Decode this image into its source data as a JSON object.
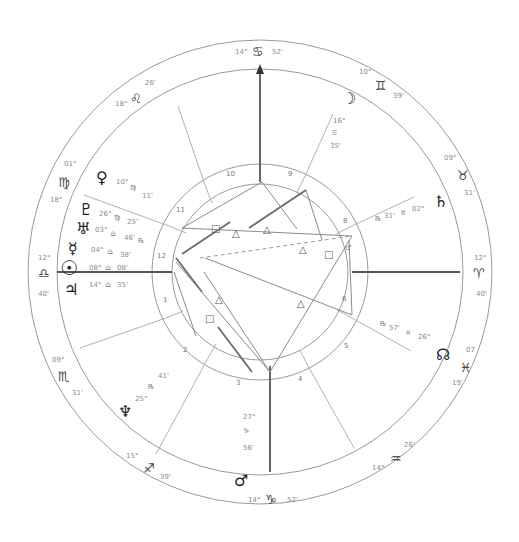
{
  "chart": {
    "type": "natal-chart-wheel",
    "center": [
      260,
      272
    ],
    "radii": {
      "outer": 232,
      "sign_inner": 203,
      "house_outer": 108,
      "house_inner": 88
    },
    "colors": {
      "ring": "#9a9a9a",
      "axis": "#555555",
      "glyph": "#222222",
      "text": "#8a8a8a"
    }
  },
  "angles": {
    "mc": {
      "label_deg": "14°",
      "sign": "♋",
      "label_min": "52'"
    },
    "ic": {
      "label_deg": "14°",
      "sign": "♑",
      "label_min": "52'"
    },
    "asc": {
      "label_deg": "12°",
      "sign": "♎",
      "label_min": "40'"
    },
    "dsc": {
      "label_deg": "12°",
      "sign": "♈",
      "label_min": "40'"
    }
  },
  "sign_cusps": [
    {
      "deg": "10°",
      "sign": "♊",
      "min": "39'"
    },
    {
      "deg": "09°",
      "sign": "♉",
      "min": "31'"
    },
    {
      "deg": "07",
      "sign": "♓",
      "min": "19'"
    },
    {
      "deg": "26'",
      "sign": "♒",
      "min": "14°"
    },
    {
      "deg": "15°",
      "sign": "♐",
      "min": "39'"
    },
    {
      "deg": "09°",
      "sign": "♏",
      "min": "31'"
    },
    {
      "deg": "01°",
      "sign": "♍",
      "min": "18°"
    },
    {
      "deg": "18°",
      "sign": "♌",
      "min": "26'"
    }
  ],
  "planets": [
    {
      "name": "moon",
      "glyph": "☽",
      "deg": "16°",
      "sign": "♋",
      "min": "35'"
    },
    {
      "name": "saturn",
      "glyph": "♄",
      "deg": "31'",
      "sign": "♉",
      "min": "02°",
      "retro": "℞"
    },
    {
      "name": "north-node",
      "glyph": "☊",
      "deg": "57'",
      "sign": "♓",
      "min": "26°",
      "retro": "℞"
    },
    {
      "name": "mars",
      "glyph": "♂",
      "deg": "27°",
      "sign": "♑",
      "min": "56'"
    },
    {
      "name": "neptune",
      "glyph": "♆",
      "deg": "25°",
      "sign": "♐",
      "min": "41'",
      "retro": "℞"
    },
    {
      "name": "venus",
      "glyph": "♀",
      "deg": "10°",
      "sign": "♍",
      "min": "11'"
    },
    {
      "name": "pluto",
      "glyph": "♇",
      "deg": "26°",
      "sign": "♍",
      "min": "25'"
    },
    {
      "name": "uranus",
      "glyph": "♅",
      "deg": "03°",
      "sign": "♎",
      "min": "46'",
      "retro": "℞"
    },
    {
      "name": "mercury",
      "glyph": "☿",
      "deg": "04°",
      "sign": "♎",
      "min": "38'"
    },
    {
      "name": "sun",
      "glyph": "☉",
      "deg": "08°",
      "sign": "♎",
      "min": "08'"
    },
    {
      "name": "jupiter",
      "glyph": "♃",
      "deg": "14°",
      "sign": "♎",
      "min": "35'"
    }
  ],
  "houses": [
    "1",
    "2",
    "3",
    "4",
    "5",
    "6",
    "7",
    "8",
    "9",
    "10",
    "11",
    "12"
  ],
  "aspect_glyphs": {
    "square": "□",
    "trine": "△",
    "sextile": "✱",
    "opposition": "☍"
  }
}
